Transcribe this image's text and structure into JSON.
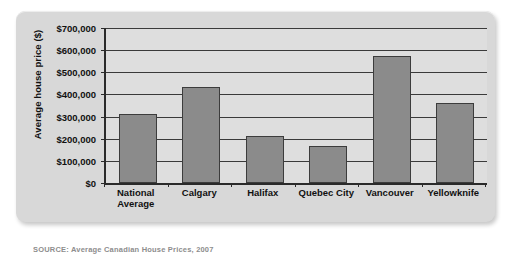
{
  "chart_data": {
    "type": "bar",
    "title": "",
    "xlabel": "",
    "ylabel": "Average house price ($)",
    "categories": [
      "National\nAverage",
      "Calgary",
      "Halifax",
      "Quebec City",
      "Vancouver",
      "Yellowknife"
    ],
    "values": [
      312000,
      435000,
      213000,
      165000,
      573000,
      362000
    ],
    "ylim": [
      0,
      700000
    ],
    "ytick_values": [
      0,
      100000,
      200000,
      300000,
      400000,
      500000,
      600000,
      700000
    ],
    "ytick_labels": [
      "$0",
      "$100,000",
      "$200,000",
      "$300,000",
      "$400,000",
      "$500,000",
      "$600,000",
      "$700,000"
    ],
    "grid": true,
    "legend": null,
    "bar_color": "#8b8b8b",
    "bar_edge_color": "#3c3c3c",
    "plot_background": "#dedede",
    "panel_background": "#d8d8d8",
    "axis_color": "#2a2a2a"
  },
  "caption": {
    "text": "SOURCE: Average Canadian House Prices, 2007"
  }
}
